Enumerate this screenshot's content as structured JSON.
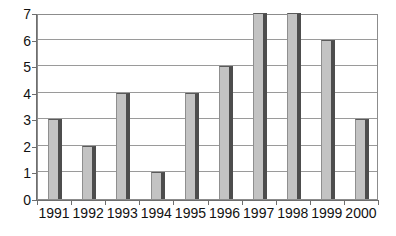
{
  "chart_data": {
    "type": "bar",
    "title": "",
    "subtitle": "",
    "xlabel": "",
    "ylabel": "",
    "categories": [
      "1991",
      "1992",
      "1993",
      "1994",
      "1995",
      "1996",
      "1997",
      "1998",
      "1999",
      "2000"
    ],
    "values": [
      3,
      2,
      4,
      1,
      4,
      5,
      7,
      7,
      6,
      3
    ],
    "series": [
      {
        "name": "",
        "values": [
          3,
          2,
          4,
          1,
          4,
          5,
          7,
          7,
          6,
          3
        ]
      }
    ],
    "ylim": [
      0,
      7
    ],
    "xlim_categories": 10,
    "y_ticks": [
      0,
      1,
      2,
      3,
      4,
      5,
      6,
      7
    ],
    "y_tick_labels": [
      "0",
      "1",
      "2",
      "3",
      "4",
      "5",
      "6",
      "7"
    ],
    "grid": true,
    "grid_axis": "y",
    "legend": false,
    "legend_position": "none",
    "annotations": [],
    "colors": {
      "bar_fill": "#c3c3c3",
      "bar_shadow": "#4d4d4d",
      "bar_outline": "#5a5a5a",
      "gridline": "#9a9a9a",
      "axis": "#6e6e6e",
      "frame": "#8c8c8c",
      "background": "#ffffff",
      "text": "#111111"
    }
  }
}
